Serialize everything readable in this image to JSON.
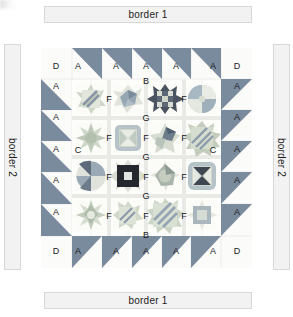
{
  "borders": {
    "top_label": "border 1",
    "bottom_label": "border 1",
    "left_label": "border 2",
    "right_label": "border 2"
  },
  "colors": {
    "triangle": "#7b8b9e",
    "triangle_dark": "#5f7085",
    "background": "#ffffff",
    "sashing": "#f4f4f2",
    "bar_fill": "#f2f2f2",
    "bar_stroke": "#d8d8d8",
    "grid_line": "#dfe2e0",
    "label_text": "#1a1a1a",
    "navy": "#3e4a5c",
    "slate": "#8c9aa8",
    "sage": "#a9b89a",
    "teal": "#8fb0ae",
    "cream": "#efeee6",
    "stone": "#c9c7bd",
    "charcoal": "#2f3338",
    "mauve": "#b7a9ae"
  },
  "quilt": {
    "top_row_labels": [
      "D",
      "A",
      "A",
      "A",
      "A",
      "A",
      "D"
    ],
    "bottom_row_labels": [
      "D",
      "A",
      "A",
      "A",
      "A",
      "A",
      "D"
    ],
    "left_col_labels": [
      "A",
      "A",
      "A",
      "A",
      "A"
    ],
    "right_col_labels": [
      "A",
      "A",
      "A",
      "A",
      "A"
    ],
    "inner_labels": {
      "top_center": "B",
      "bottom_center": "B",
      "left_center": "C",
      "right_center": "C",
      "vertical_sashing": [
        "G",
        "G",
        "G"
      ],
      "horizontal_sashing": [
        "F",
        "F",
        "F",
        "F",
        "F",
        "F",
        "F",
        "F",
        "F",
        "F",
        "F",
        "F"
      ]
    },
    "blocks": [
      {
        "row": 1,
        "col": 1,
        "name": "diagonal-stripe-star"
      },
      {
        "row": 1,
        "col": 2,
        "name": "pinwheel-star"
      },
      {
        "row": 1,
        "col": 3,
        "name": "dark-sawtooth-star"
      },
      {
        "row": 1,
        "col": 4,
        "name": "circular-pinwheel"
      },
      {
        "row": 2,
        "col": 1,
        "name": "eight-point-star"
      },
      {
        "row": 2,
        "col": 2,
        "name": "framed-square-star"
      },
      {
        "row": 2,
        "col": 3,
        "name": "broken-star"
      },
      {
        "row": 2,
        "col": 4,
        "name": "diagonal-stripe-sunburst"
      },
      {
        "row": 3,
        "col": 1,
        "name": "quarter-circle-pinwheel"
      },
      {
        "row": 3,
        "col": 2,
        "name": "dark-center-square-star"
      },
      {
        "row": 3,
        "col": 3,
        "name": "curved-four-point-star"
      },
      {
        "row": 3,
        "col": 4,
        "name": "hourglass-square-star"
      },
      {
        "row": 4,
        "col": 1,
        "name": "double-star"
      },
      {
        "row": 4,
        "col": 2,
        "name": "small-diagonal-stripe-star"
      },
      {
        "row": 4,
        "col": 3,
        "name": "large-diagonal-stripe-star"
      },
      {
        "row": 4,
        "col": 4,
        "name": "square-in-square-star"
      }
    ]
  }
}
